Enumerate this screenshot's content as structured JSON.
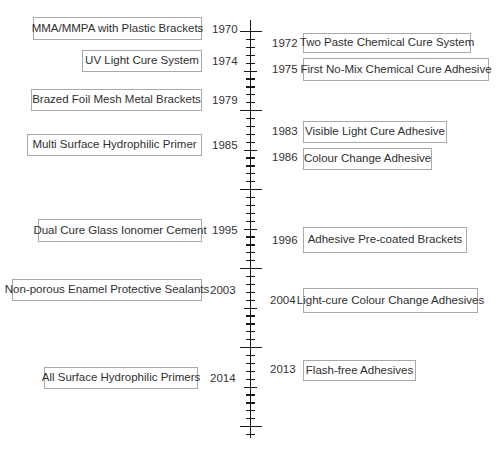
{
  "title": "",
  "axis": {
    "start_year": 1970,
    "end_year": 2021,
    "major_tick_years": [
      1970,
      1980,
      1990,
      2000,
      2010,
      2020
    ]
  },
  "left_events": [
    {
      "year": "1970",
      "label": "MMA/MMPA with Plastic Brackets"
    },
    {
      "year": "1974",
      "label": "UV Light Cure System"
    },
    {
      "year": "1979",
      "label": "Brazed Foil Mesh Metal Brackets"
    },
    {
      "year": "1985",
      "label": "Multi Surface Hydrophilic Primer"
    },
    {
      "year": "1995",
      "label": "Dual Cure Glass Ionomer Cement"
    },
    {
      "year": "2003",
      "label": "Non-porous Enamel Protective Sealants"
    },
    {
      "year": "2014",
      "label": "All Surface Hydrophilic Primers"
    }
  ],
  "right_events": [
    {
      "year": "1972",
      "label": "Two Paste Chemical Cure System"
    },
    {
      "year": "1975",
      "label": "First No-Mix Chemical Cure Adhesive"
    },
    {
      "year": "1983",
      "label": "Visible Light Cure Adhesive"
    },
    {
      "year": "1986",
      "label": "Colour Change Adhesive"
    },
    {
      "year": "1996",
      "label": "Adhesive Pre-coated Brackets"
    },
    {
      "year": "2004",
      "label": "Light-cure Colour Change Adhesives"
    },
    {
      "year": "2013",
      "label": "Flash-free Adhesives"
    }
  ],
  "colors": {
    "box_border": "#a9a9a9",
    "axis": "#1a1a1a",
    "text": "#2f2f2f"
  }
}
